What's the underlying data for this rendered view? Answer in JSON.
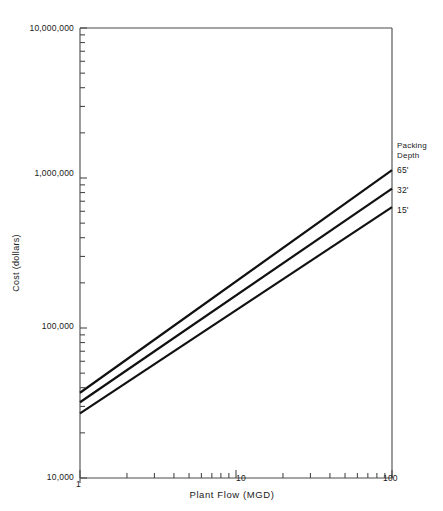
{
  "chart_data": {
    "type": "line",
    "title": "",
    "xlabel": "Plant Flow (MGD)",
    "ylabel": "Cost (dollars)",
    "xscale": "log",
    "yscale": "log",
    "xlim": [
      1,
      100
    ],
    "ylim": [
      10000,
      10000000
    ],
    "grid": false,
    "xtick_labels": [
      "1",
      "10",
      "100"
    ],
    "xtick_values": [
      1,
      10,
      100
    ],
    "xtick_labels_shown": [
      "10",
      "100"
    ],
    "ytick_labels": [
      "10,000",
      "100,000",
      "1,000,000",
      "10,000,000"
    ],
    "ytick_values": [
      10000,
      100000,
      1000000,
      10000000
    ],
    "legend_title_line1": "Packing",
    "legend_title_line2": "Depth",
    "legend_position": "right-outside",
    "series": [
      {
        "name": "65'",
        "label": "65'",
        "color": "#111111",
        "x": [
          1,
          100
        ],
        "values": [
          37000,
          1130000
        ]
      },
      {
        "name": "32'",
        "label": "32'",
        "color": "#111111",
        "x": [
          1,
          100
        ],
        "values": [
          32000,
          850000
        ]
      },
      {
        "name": "15'",
        "label": "15'",
        "color": "#111111",
        "x": [
          1,
          100
        ],
        "values": [
          27000,
          640000
        ]
      }
    ]
  },
  "axis": {
    "y_top_label": "10,000,000",
    "y_mid_high_label": "1,000,000",
    "y_mid_low_label": "100,000",
    "y_bottom_label": "10,000",
    "x_left_label": "1",
    "x_mid_label": "10",
    "x_right_label": "100",
    "x_title": "Plant Flow (MGD)",
    "y_title": "Cost (dollars)"
  },
  "legend": {
    "title_line1": "Packing",
    "title_line2": "Depth",
    "items": [
      {
        "label": "65'"
      },
      {
        "label": "32'"
      },
      {
        "label": "15'"
      }
    ]
  },
  "colors": {
    "line": "#111111",
    "axis": "#4a4a4a",
    "text": "#1a1a1a",
    "background": "#ffffff"
  }
}
